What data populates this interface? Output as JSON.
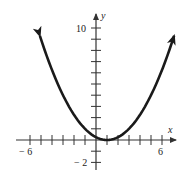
{
  "chart_data": {
    "type": "line",
    "title": "",
    "function": "y = (x - 1)^2 / 4",
    "xlabel": "x",
    "ylabel": "y",
    "xlim": [
      -6,
      7
    ],
    "ylim": [
      -2,
      11
    ],
    "grid": false,
    "x_tick_labels": [
      "-6",
      "6"
    ],
    "y_tick_labels": [
      "10",
      "-2"
    ],
    "x_ticks": [
      -6,
      -5,
      -4,
      -3,
      -2,
      -1,
      1,
      2,
      3,
      4,
      5,
      6
    ],
    "y_ticks": [
      -2,
      -1,
      1,
      2,
      3,
      4,
      5,
      6,
      7,
      8,
      9,
      10
    ],
    "series": [
      {
        "name": "parabola",
        "x": [
          -5.1,
          -4,
          -3,
          -2,
          -1,
          0,
          1,
          2,
          3,
          4,
          5,
          6,
          7.1
        ],
        "y": [
          9.3,
          6.25,
          4,
          2.25,
          1,
          0.25,
          0,
          0.25,
          1,
          2.25,
          4,
          6.25,
          9.3
        ],
        "arrows_at_ends": true
      }
    ],
    "colors": {
      "axis": "#333333",
      "curve": "#1a1a1a"
    }
  },
  "labels": {
    "x_axis": "x",
    "y_axis": "y",
    "x_min_label": "− 6",
    "x_max_label": "6",
    "y_max_label": "10",
    "y_min_label": "− 2"
  }
}
